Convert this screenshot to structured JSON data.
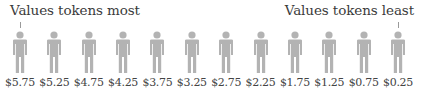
{
  "labels": {
    "left": "Values tokens most",
    "right": "Values tokens least"
  },
  "colors": {
    "figure": "#b3b3b3",
    "text": "#3b3b3b",
    "tick": "#9a9a9a"
  },
  "figures": [
    {
      "icon": "person-icon",
      "price": "$5.75"
    },
    {
      "icon": "person-icon",
      "price": "$5.25"
    },
    {
      "icon": "person-icon",
      "price": "$4.75"
    },
    {
      "icon": "person-icon",
      "price": "$4.25"
    },
    {
      "icon": "person-icon",
      "price": "$3.75"
    },
    {
      "icon": "person-icon",
      "price": "$3.25"
    },
    {
      "icon": "person-icon",
      "price": "$2.75"
    },
    {
      "icon": "person-icon",
      "price": "$2.25"
    },
    {
      "icon": "person-icon",
      "price": "$1.75"
    },
    {
      "icon": "person-icon",
      "price": "$1.25"
    },
    {
      "icon": "person-icon",
      "price": "$0.75"
    },
    {
      "icon": "person-icon",
      "price": "$0.25"
    }
  ]
}
